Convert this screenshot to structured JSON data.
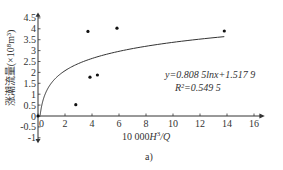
{
  "chart_data": {
    "type": "scatter",
    "title": "",
    "xlabel": "10 000H³/Q",
    "ylabel": "涨潮流量(×10⁸m³)",
    "xlim": [
      -0.5,
      16.5
    ],
    "ylim": [
      -1,
      4.7
    ],
    "x_ticks": [
      "0",
      "2",
      "4",
      "6",
      "8",
      "10",
      "12",
      "14",
      "16"
    ],
    "y_ticks": [
      "4.5",
      "4",
      "3.5",
      "3",
      "2.5",
      "2",
      "1.5",
      "1",
      "0.5",
      "0",
      "-0.5",
      "-1"
    ],
    "grid": false,
    "series": [
      {
        "name": "observed",
        "points": [
          {
            "x": 0.0,
            "y": 0.0
          },
          {
            "x": 2.8,
            "y": 0.52
          },
          {
            "x": 3.7,
            "y": 3.88
          },
          {
            "x": 3.85,
            "y": 1.78
          },
          {
            "x": 4.4,
            "y": 1.88
          },
          {
            "x": 5.85,
            "y": 4.03
          },
          {
            "x": 13.8,
            "y": 3.9
          }
        ]
      },
      {
        "name": "log fit",
        "equation": "y=0.808 5lnx+1.517 9",
        "a": 0.8085,
        "b": 1.5179,
        "x_range": [
          0.16,
          13.8
        ]
      }
    ],
    "annotations": [
      "y=0.808 5lnx+1.517 9",
      "R²=0.549 5"
    ],
    "r_squared": 0.5495,
    "panel_label": "a)"
  },
  "labels": {
    "equation": "y=0.808 5lnx+1.517 9",
    "r2": "R²=0.549 5",
    "xlabel_prefix": "10 000",
    "xlabel_H": "H",
    "xlabel_sup": "3",
    "xlabel_Q": "/Q",
    "ylabel": "涨潮流量(×10⁸m³)",
    "panel": "a)"
  }
}
